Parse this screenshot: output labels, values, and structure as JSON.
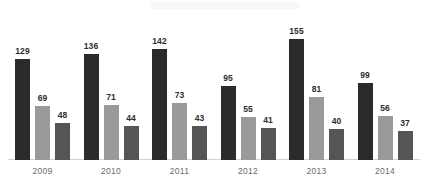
{
  "chart_data": {
    "type": "bar",
    "title": "",
    "xlabel": "",
    "ylabel": "",
    "grid": false,
    "legend": "none",
    "ylim": [
      0,
      155
    ],
    "categories": [
      "2009",
      "2010",
      "2011",
      "2012",
      "2013",
      "2014"
    ],
    "series": [
      {
        "name": "series-1",
        "color": "#2b2b2b",
        "values": [
          129,
          136,
          142,
          95,
          155,
          99
        ]
      },
      {
        "name": "series-2",
        "color": "#9a9a9a",
        "values": [
          69,
          71,
          73,
          55,
          81,
          56
        ]
      },
      {
        "name": "series-3",
        "color": "#555555",
        "values": [
          48,
          44,
          43,
          41,
          40,
          37
        ]
      }
    ]
  },
  "axis": {
    "baseline_color": "#d2d2d2"
  },
  "background": "#ffffff"
}
